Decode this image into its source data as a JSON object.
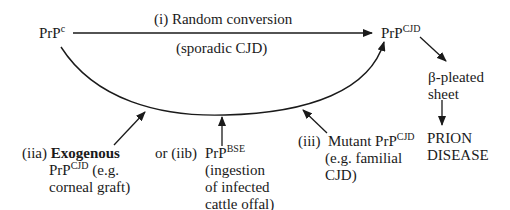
{
  "diagram": {
    "nodes": {
      "prp_c": {
        "base": "PrP",
        "sup": "c"
      },
      "prp_cjd": {
        "base": "PrP",
        "sup": "CJD"
      },
      "beta_sheet": {
        "line1": "β-pleated",
        "line2": "sheet"
      },
      "prion_disease": {
        "line1": "PRION",
        "line2": "DISEASE"
      }
    },
    "top_arrow": {
      "label_above": "(i)  Random conversion",
      "label_below": "(sporadic CJD)"
    },
    "routes": {
      "iia": {
        "num": "(iia)",
        "bold": "Exogenous",
        "base": "PrP",
        "sup": "CJD",
        "rest1": " (e.g.",
        "line3": "corneal graft)"
      },
      "iib": {
        "prefix": "or (iib)",
        "base": "PrP",
        "sup": "BSE",
        "line2": "(ingestion",
        "line3": "of infected",
        "line4": "cattle offal)"
      },
      "iii": {
        "num": "(iii)",
        "text": "Mutant PrP",
        "sup": "CJD",
        "line2": "(e.g. familial",
        "line3": "CJD)"
      }
    }
  }
}
